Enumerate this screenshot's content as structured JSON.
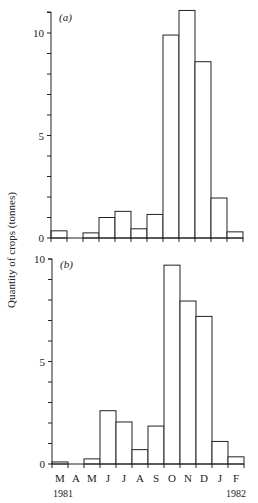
{
  "chart_data": [
    {
      "type": "bar",
      "panel_label": "(a)",
      "title": "",
      "xlabel": "",
      "ylabel": "Quantity of crops (tonnes)",
      "categories": [
        "M",
        "A",
        "M",
        "J",
        "J",
        "A",
        "S",
        "O",
        "N",
        "D",
        "J",
        "F"
      ],
      "values": [
        0.35,
        0,
        0.25,
        1.0,
        1.3,
        0.45,
        1.15,
        9.9,
        11.1,
        8.6,
        1.95,
        0.3
      ],
      "ylim": [
        0,
        11.3
      ],
      "yticks": [
        0,
        5,
        10
      ],
      "minor_tick_step": 1,
      "grid": false
    },
    {
      "type": "bar",
      "panel_label": "(b)",
      "title": "",
      "xlabel": "",
      "ylabel": "Quantity of crops (tonnes)",
      "categories": [
        "M",
        "A",
        "M",
        "J",
        "J",
        "A",
        "S",
        "O",
        "N",
        "D",
        "J",
        "F"
      ],
      "values": [
        0.1,
        0,
        0.25,
        2.6,
        2.05,
        0.7,
        1.85,
        9.7,
        7.95,
        7.2,
        1.1,
        0.35
      ],
      "ylim": [
        0,
        10
      ],
      "yticks": [
        0,
        5,
        10
      ],
      "minor_tick_step": 1,
      "grid": false
    }
  ],
  "axis": {
    "ylabel": "Quantity of crops (tonnes)",
    "month_labels": [
      "M",
      "A",
      "M",
      "J",
      "J",
      "A",
      "S",
      "O",
      "N",
      "D",
      "J",
      "F"
    ],
    "year_start": "1981",
    "year_end": "1982"
  },
  "colors": {
    "stroke": "#222222",
    "fill": "#ffffff"
  }
}
